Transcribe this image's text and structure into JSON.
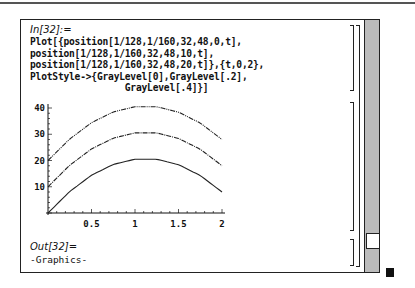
{
  "notebook": {
    "input_label": "In[32]:=",
    "input_code": [
      "Plot[{position[1/128,1/160,32,48,0,t],",
      "position[1/128,1/160,32,48,10,t],",
      "position[1/128,1/160,32,48,20,t]},{t,0,2},",
      "PlotStyle->{GrayLevel[0],GrayLevel[.2],",
      "                 GrayLevel[.4]}]"
    ],
    "output_label": "Out[32]=",
    "output_value": "-Graphics-"
  },
  "chart_data": {
    "type": "line",
    "title": "",
    "xlabel": "",
    "ylabel": "",
    "xlim": [
      0,
      2
    ],
    "ylim": [
      0,
      42
    ],
    "x_ticks": [
      "0.5",
      "1",
      "1.5",
      "2"
    ],
    "y_ticks": [
      "10",
      "20",
      "30",
      "40"
    ],
    "grid": false,
    "legend": "none",
    "x": [
      0,
      0.25,
      0.5,
      0.75,
      1.0,
      1.25,
      1.5,
      1.75,
      2.0
    ],
    "series": [
      {
        "name": "position[...,0,t]",
        "style": "solid",
        "gray": "GrayLevel[0]",
        "values": [
          0,
          8.2,
          14.4,
          18.5,
          20.5,
          20.5,
          18.4,
          14.3,
          8
        ]
      },
      {
        "name": "position[...,10,t]",
        "style": "dotted-dashed",
        "gray": "GrayLevel[.2]",
        "values": [
          10,
          18.2,
          24.4,
          28.5,
          30.5,
          30.5,
          28.4,
          24.3,
          18
        ]
      },
      {
        "name": "position[...,20,t]",
        "style": "dash-dot-dot",
        "gray": "GrayLevel[.4]",
        "values": [
          20,
          28.2,
          34.4,
          38.5,
          40.5,
          40.5,
          38.4,
          34.3,
          28
        ]
      }
    ]
  }
}
